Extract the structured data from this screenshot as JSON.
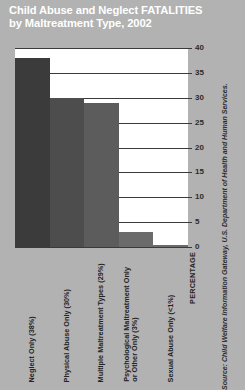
{
  "title": {
    "line1": "Child Abuse and Neglect FATALITIES",
    "line2": "by Maltreatment Type, 2002"
  },
  "source": "Source: Child Welfare Information Gateway, U.S. Department of Health and Human Services.",
  "axis": {
    "y_title": "PERCENTAGE",
    "ticks": [
      "40",
      "35",
      "30",
      "25",
      "20",
      "15",
      "10",
      "5",
      "0"
    ]
  },
  "labels": {
    "cat0": "Neglect Only (38%)",
    "cat1": "Physical Abuse Only (30%)",
    "cat2": "Multiple Maltreatment Types (29%)",
    "cat3_l1": "Psychological Maltreatment Only",
    "cat3_l2": "or Other Only (3%)",
    "cat4": "Sexual Abuse Only (<1%)"
  },
  "colors": {
    "background": "#b2b2b2",
    "plot_background": "#ffffff",
    "gridline": "#3a3a3a",
    "title_text": "#ffffff",
    "bar0": "#3b3b3b",
    "bar1": "#4d4d4d",
    "bar2": "#5c5c5c",
    "bar3": "#6b6b6b",
    "bar4": "#6b6b6b"
  },
  "chart_data": {
    "type": "bar",
    "title": "Child Abuse and Neglect FATALITIES by Maltreatment Type, 2002",
    "xlabel": "",
    "ylabel": "PERCENTAGE",
    "ylim": [
      0,
      40
    ],
    "ytick_step": 5,
    "yticks": [
      0,
      5,
      10,
      15,
      20,
      25,
      30,
      35,
      40
    ],
    "grid": "horizontal",
    "legend": "none",
    "categories": [
      "Neglect Only (38%)",
      "Physical Abuse Only (30%)",
      "Multiple Maltreatment Types (29%)",
      "Psychological Maltreatment Only or Other Only (3%)",
      "Sexual Abuse Only (<1%)"
    ],
    "values": [
      38,
      30,
      29,
      3,
      0.5
    ],
    "value_labels": [
      "38%",
      "30%",
      "29%",
      "3%",
      "<1%"
    ],
    "source": "Source: Child Welfare Information Gateway, U.S. Department of Health and Human Services."
  }
}
